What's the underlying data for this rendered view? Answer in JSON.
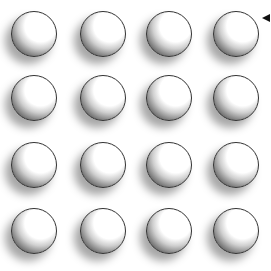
{
  "grid": {
    "rows": 4,
    "cols": 4,
    "col_centers": [
      34,
      103,
      169,
      236
    ],
    "row_centers": [
      34,
      98,
      165,
      231
    ],
    "radius": 23,
    "shade_color": "#2a2a2a",
    "highlight_color": "#ffffff",
    "outline_color": "#333333"
  },
  "pointer": {
    "icon": "left-arrow-icon",
    "color": "#111111"
  }
}
